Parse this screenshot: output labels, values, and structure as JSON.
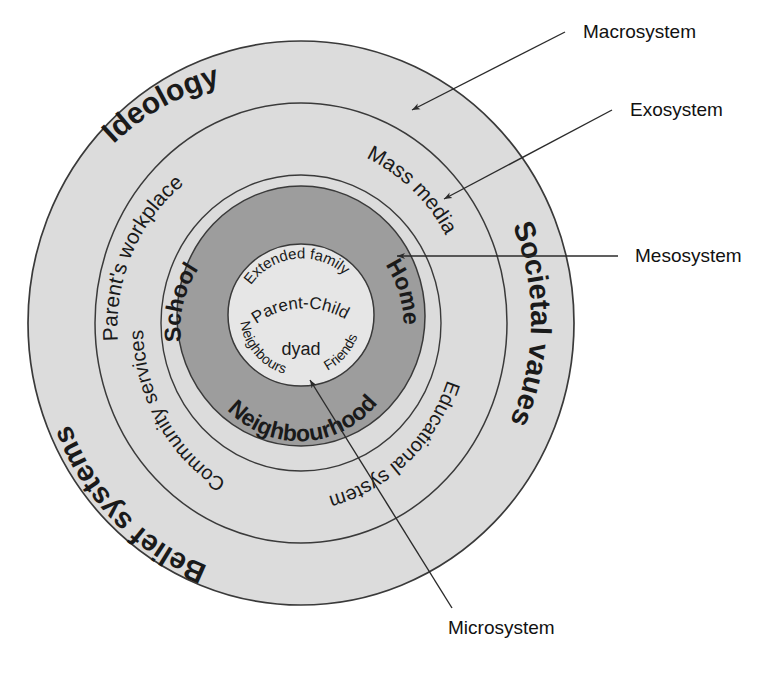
{
  "diagram": {
    "type": "concentric-rings"
  },
  "colors": {
    "macrosystem_fill": "#dcdcdc",
    "exosystem_fill": "#dcdcdc",
    "mesosystem_fill": "#e3e3e3",
    "microsystem_fill": "#9d9d9d",
    "core_fill": "#e8e8e8",
    "outline": "#3a3a3a",
    "text": "#1a1a1a",
    "background": "#ffffff"
  },
  "rings": {
    "macrosystem": {
      "name": "Macrosystem",
      "labels": [
        {
          "text": "Ideology",
          "id": "ideology"
        },
        {
          "text": "Societal vaues",
          "id": "societal-vaues"
        },
        {
          "text": "Belief systems",
          "id": "belief-systems"
        }
      ]
    },
    "exosystem": {
      "name": "Exosystem",
      "labels": [
        {
          "text": "Parent's workplace",
          "id": "parents-workplace"
        },
        {
          "text": "Mass media",
          "id": "mass-media"
        },
        {
          "text": "Educational system",
          "id": "educational-system"
        },
        {
          "text": "Community services",
          "id": "community-services"
        }
      ]
    },
    "microsystem": {
      "name": "Microsystem",
      "labels": [
        {
          "text": "School",
          "id": "school"
        },
        {
          "text": "Home",
          "id": "home"
        },
        {
          "text": "Neighbourhood",
          "id": "neighbourhood"
        }
      ]
    },
    "core": {
      "name": "Core",
      "labels": [
        {
          "text": "Extended family",
          "id": "extended-family"
        },
        {
          "text": "Parent-Child",
          "id": "parent-child"
        },
        {
          "text": "dyad",
          "id": "dyad"
        },
        {
          "text": "Neighbours",
          "id": "neighbours"
        },
        {
          "text": "Friends",
          "id": "friends"
        }
      ]
    }
  },
  "callouts": [
    {
      "id": "macrosystem",
      "text": "Macrosystem"
    },
    {
      "id": "exosystem",
      "text": "Exosystem"
    },
    {
      "id": "mesosystem",
      "text": "Mesosystem"
    },
    {
      "id": "microsystem",
      "text": "Microsystem"
    }
  ]
}
